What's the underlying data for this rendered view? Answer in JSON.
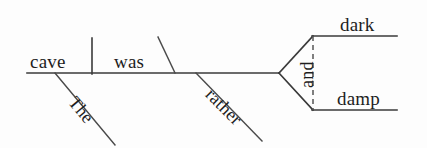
{
  "diagram": {
    "type": "reed-kellogg-sentence-diagram",
    "sentence": "The cave was rather dark and damp.",
    "canvas": {
      "width": 427,
      "height": 148,
      "background": "#fdfdfd"
    },
    "ink_color": "#3a3a3a",
    "text_color": "#1e1e1e",
    "labels": {
      "subject": "cave",
      "verb": "was",
      "article": "The",
      "adverb": "rather",
      "conjunction": "and",
      "complement_upper": "dark",
      "complement_lower": "damp"
    },
    "strokes": {
      "baseline": {
        "x1": 27,
        "y1": 73,
        "x2": 279,
        "y2": 73
      },
      "subject_verb_divider": {
        "x1": 92,
        "y1": 38,
        "x2": 92,
        "y2": 74
      },
      "complement_slant": {
        "x1": 175,
        "y1": 73,
        "x2": 158,
        "y2": 37
      },
      "article_slant": {
        "x1": 55,
        "y1": 73,
        "x2": 115,
        "y2": 145
      },
      "adverb_slant": {
        "x1": 196,
        "y1": 73,
        "x2": 262,
        "y2": 141
      },
      "fork_upper": {
        "x1": 279,
        "y1": 73,
        "x2": 313,
        "y2": 36
      },
      "fork_lower": {
        "x1": 279,
        "y1": 73,
        "x2": 313,
        "y2": 110
      },
      "branch_upper": {
        "x1": 313,
        "y1": 36,
        "x2": 397,
        "y2": 36
      },
      "branch_lower": {
        "x1": 313,
        "y1": 110,
        "x2": 397,
        "y2": 110
      },
      "conjunction_dashed": {
        "x1": 313,
        "y1": 36,
        "x2": 313,
        "y2": 110
      }
    }
  }
}
